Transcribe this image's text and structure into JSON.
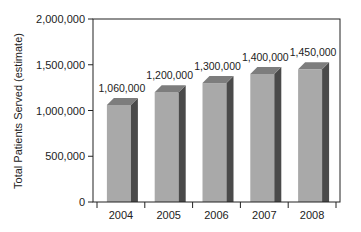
{
  "chart_data": {
    "type": "bar",
    "title": "",
    "xlabel": "",
    "ylabel": "Total Patients Served (estimate)",
    "categories": [
      "2004",
      "2005",
      "2006",
      "2007",
      "2008"
    ],
    "values": [
      1060000,
      1200000,
      1300000,
      1400000,
      1450000
    ],
    "data_labels": [
      "1,060,000",
      "1,200,000",
      "1,300,000",
      "1,400,000",
      "1,450,000"
    ],
    "ylim": [
      0,
      2000000
    ],
    "yticks": [
      0,
      500000,
      1000000,
      1500000,
      2000000
    ],
    "ytick_labels": [
      "0",
      "500,000",
      "1,000,000",
      "1,500,000",
      "2,000,000"
    ],
    "grid": false,
    "legend": null,
    "style": "3d-bar"
  },
  "colors": {
    "bar_front": "#a9a9a9",
    "bar_side": "#4a4a4a",
    "bar_top": "#7d7d7d",
    "axis": "#222222"
  }
}
